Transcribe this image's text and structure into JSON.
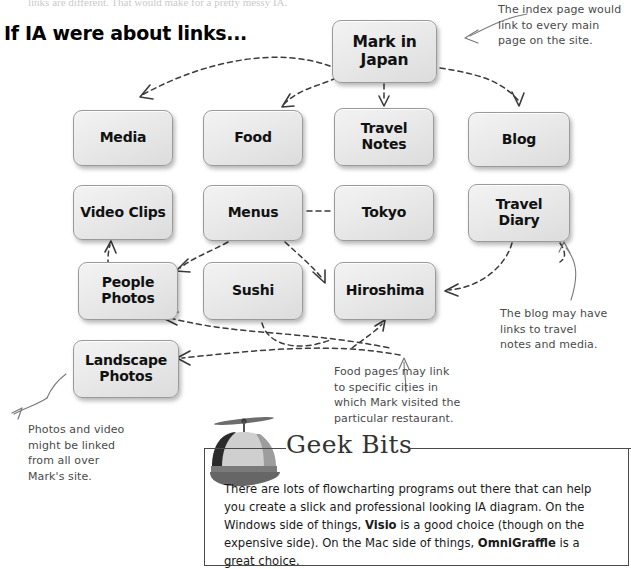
{
  "page": {
    "cutoff_text": "links are different. That would make for a pretty messy IA.",
    "headline": "If IA were about links..."
  },
  "diagram": {
    "nodes": [
      {
        "id": "mark-in-japan",
        "label": "Mark in\nJapan"
      },
      {
        "id": "media",
        "label": "Media"
      },
      {
        "id": "food",
        "label": "Food"
      },
      {
        "id": "travel-notes",
        "label": "Travel\nNotes"
      },
      {
        "id": "blog",
        "label": "Blog"
      },
      {
        "id": "video-clips",
        "label": "Video Clips"
      },
      {
        "id": "menus",
        "label": "Menus"
      },
      {
        "id": "tokyo",
        "label": "Tokyo"
      },
      {
        "id": "travel-diary",
        "label": "Travel\nDiary"
      },
      {
        "id": "people-photos",
        "label": "People\nPhotos"
      },
      {
        "id": "sushi",
        "label": "Sushi"
      },
      {
        "id": "hiroshima",
        "label": "Hiroshima"
      },
      {
        "id": "landscape-photos",
        "label": "Landscape\nPhotos"
      }
    ]
  },
  "annotations": [
    {
      "id": "index-page-note",
      "text": "The index page would\nlink to every main\npage on the site."
    },
    {
      "id": "blog-links-note",
      "text": "The blog may have\nlinks to travel\nnotes and media."
    },
    {
      "id": "food-pages-note",
      "text": "Food pages may link\nto specific cities in\nwhich Mark visited the\nparticular restaurant."
    },
    {
      "id": "photos-video-note",
      "text": "Photos and video\nmight be linked\nfrom all over\nMark's site."
    }
  ],
  "geek_bits": {
    "title": "Geek Bits",
    "body_parts": [
      {
        "text": "There are lots of flowcharting programs out there that can help you create a slick and professional looking IA diagram. On the Windows side of things, ",
        "bold": false
      },
      {
        "text": "Visio",
        "bold": true
      },
      {
        "text": " is a good choice (though on the expensive side). On the Mac side of things, ",
        "bold": false
      },
      {
        "text": "OmniGraffle",
        "bold": true
      },
      {
        "text": " is a great choice.",
        "bold": false
      }
    ],
    "icon": "propeller-cap-icon"
  },
  "colors": {
    "node_fill": "#eaeaea",
    "node_border": "#9a9a9a",
    "arrow": "#3b3b3b",
    "annotation_text": "#4a4a4a",
    "rule": "#4a4a4a"
  }
}
